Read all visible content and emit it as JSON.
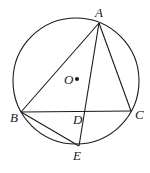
{
  "diagram": {
    "type": "geometry",
    "stroke_color": "#1a1a1a",
    "circle": {
      "center": "O",
      "cx": 76,
      "cy": 81,
      "r": 63
    },
    "points": {
      "A": {
        "label": "A",
        "x": 99,
        "y": 23
      },
      "B": {
        "label": "B",
        "x": 21,
        "y": 112
      },
      "C": {
        "label": "C",
        "x": 131,
        "y": 111
      },
      "D": {
        "label": "D",
        "x": 85,
        "y": 111
      },
      "E": {
        "label": "E",
        "x": 79,
        "y": 146
      },
      "O": {
        "label": "O",
        "x": 77,
        "y": 79
      }
    },
    "segments": [
      "AB",
      "AC",
      "BC",
      "AE",
      "BE"
    ]
  }
}
